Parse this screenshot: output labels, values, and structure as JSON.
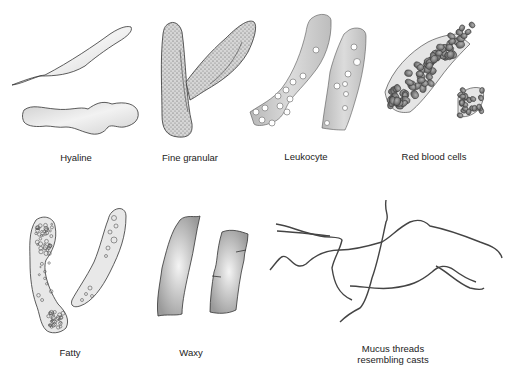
{
  "figure": {
    "panels": [
      {
        "id": "hyaline",
        "label": "Hyaline"
      },
      {
        "id": "fine-granular",
        "label": "Fine granular"
      },
      {
        "id": "leukocyte",
        "label": "Leukocyte"
      },
      {
        "id": "red-blood-cells",
        "label": "Red blood cells"
      },
      {
        "id": "fatty",
        "label": "Fatty"
      },
      {
        "id": "waxy",
        "label": "Waxy"
      },
      {
        "id": "mucus-threads",
        "label_lines": [
          "Mucus threads",
          "resembling casts"
        ]
      }
    ]
  },
  "colors": {
    "outline": "#333333",
    "cast_fill_light": "#e6e6e6",
    "cast_fill_mid": "#c4c4c4",
    "cell_fill": "#8a8a8a",
    "background": "#ffffff"
  }
}
